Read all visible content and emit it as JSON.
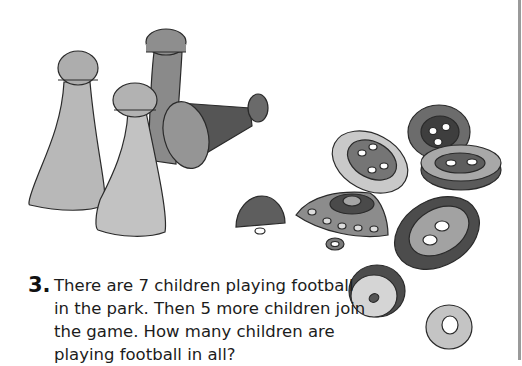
{
  "illustration": {
    "description": "Grayscale watercolor illustration of game pieces (pawns) and buttons",
    "items": [
      "pawn",
      "pawn",
      "pawn",
      "tipped-pawn",
      "half-dome-button",
      "four-hole-button",
      "shank-button",
      "four-hole-button",
      "two-hole-button",
      "two-hole-button",
      "dome-button",
      "ring-button"
    ]
  },
  "question": {
    "number": "3.",
    "text": "There are 7 children playing football in the park. Then 5 more children join the game. How many children are playing football in all?"
  },
  "colors": {
    "background": "#ffffff",
    "text": "#1c1c1c",
    "edge_line": "#9a9a9a"
  }
}
